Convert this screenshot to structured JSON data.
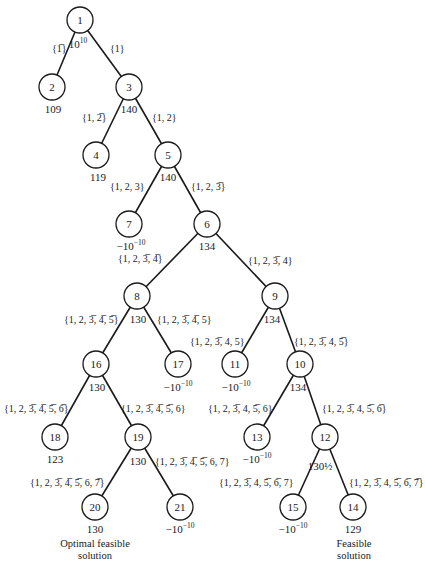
{
  "diagram": {
    "type": "branch-and-bound-tree",
    "nodes": [
      {
        "id": "1",
        "x": 80,
        "y": 20,
        "bound": "10",
        "bound_sup": "10"
      },
      {
        "id": "2",
        "x": 52,
        "y": 87,
        "bound": "109"
      },
      {
        "id": "3",
        "x": 129,
        "y": 87,
        "bound": "140"
      },
      {
        "id": "4",
        "x": 96,
        "y": 155,
        "bound": "119"
      },
      {
        "id": "5",
        "x": 168,
        "y": 155,
        "bound": "140"
      },
      {
        "id": "7",
        "x": 129,
        "y": 224,
        "bound": "−10",
        "bound_sup": "−10"
      },
      {
        "id": "6",
        "x": 207,
        "y": 224,
        "bound": "134"
      },
      {
        "id": "8",
        "x": 137,
        "y": 296,
        "bound": "130"
      },
      {
        "id": "9",
        "x": 275,
        "y": 296,
        "bound": "134"
      },
      {
        "id": "16",
        "x": 96,
        "y": 364,
        "bound": "130"
      },
      {
        "id": "17",
        "x": 178,
        "y": 364,
        "bound": "−10",
        "bound_sup": "−10"
      },
      {
        "id": "11",
        "x": 235,
        "y": 364,
        "bound": "−10",
        "bound_sup": "−10"
      },
      {
        "id": "10",
        "x": 300,
        "y": 364,
        "bound": "134"
      },
      {
        "id": "18",
        "x": 55,
        "y": 437,
        "bound": "123"
      },
      {
        "id": "19",
        "x": 138,
        "y": 437,
        "bound": "130"
      },
      {
        "id": "13",
        "x": 257,
        "y": 437,
        "bound": "−10",
        "bound_sup": "−10"
      },
      {
        "id": "12",
        "x": 325,
        "y": 437,
        "bound": "130½"
      },
      {
        "id": "20",
        "x": 95,
        "y": 507,
        "bound": "130"
      },
      {
        "id": "21",
        "x": 180,
        "y": 507,
        "bound": "−10",
        "bound_sup": "−10"
      },
      {
        "id": "15",
        "x": 293,
        "y": 507,
        "bound": "−10",
        "bound_sup": "−10"
      },
      {
        "id": "14",
        "x": 353,
        "y": 507,
        "bound": "129"
      }
    ],
    "edges": [
      {
        "from": "1",
        "to": "2",
        "label": "{1̅}"
      },
      {
        "from": "1",
        "to": "3",
        "label": "{1}"
      },
      {
        "from": "3",
        "to": "4",
        "label": "{1, 2̅}"
      },
      {
        "from": "3",
        "to": "5",
        "label": "{1, 2}"
      },
      {
        "from": "5",
        "to": "7",
        "label": "{1, 2, 3}"
      },
      {
        "from": "5",
        "to": "6",
        "label": "{1, 2, 3̅}"
      },
      {
        "from": "6",
        "to": "8",
        "label": "{1, 2, 3̅, 4̅}"
      },
      {
        "from": "6",
        "to": "9",
        "label": "{1, 2, 3̅, 4}"
      },
      {
        "from": "8",
        "to": "16",
        "label": "{1, 2, 3̅, 4̅, 5̅}"
      },
      {
        "from": "8",
        "to": "17",
        "label": "{1, 2, 3̅, 4̅, 5}"
      },
      {
        "from": "9",
        "to": "11",
        "label": "{1, 2, 3̅, 4, 5}"
      },
      {
        "from": "9",
        "to": "10",
        "label": "{1, 2, 3̅, 4, 5̅}"
      },
      {
        "from": "16",
        "to": "18",
        "label": "{1, 2, 3̅, 4̅, 5̅, 6̅}"
      },
      {
        "from": "16",
        "to": "19",
        "label": "{1, 2, 3̅, 4̅, 5̅, 6}"
      },
      {
        "from": "10",
        "to": "13",
        "label": "{1, 2, 3̅, 4, 5̅, 6}"
      },
      {
        "from": "10",
        "to": "12",
        "label": "{1, 2, 3̅, 4, 5̅, 6̅}"
      },
      {
        "from": "19",
        "to": "20",
        "label": "{1, 2, 3̅, 4̅, 5̅, 6, 7̅}"
      },
      {
        "from": "19",
        "to": "21",
        "label": "{1, 2, 3̅, 4̅, 5̅, 6, 7}"
      },
      {
        "from": "12",
        "to": "15",
        "label": "{1, 2, 3̅, 4, 5̅, 6̅, 7}"
      },
      {
        "from": "12",
        "to": "14",
        "label": "{1, 2, 3̅, 4, 5̅, 6̅, 7̅}"
      }
    ],
    "captions": {
      "optimal_line1": "Optimal feasible",
      "optimal_line2": "solution",
      "feasible_line1": "Feasible",
      "feasible_line2": "solution"
    },
    "edge_color": "#1a1a1a",
    "background": "#ffffff"
  }
}
